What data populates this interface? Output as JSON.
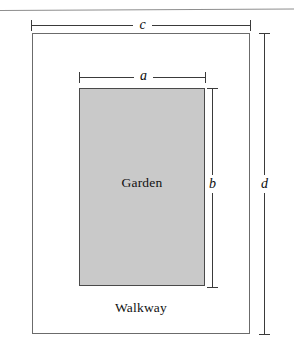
{
  "figure": {
    "type": "geometry-diagram",
    "background_color": "#ffffff",
    "page_rule": {
      "name": "page-rule",
      "color": "#8e8e8e"
    },
    "regions": [
      {
        "key": "walkway",
        "label": "Walkway",
        "fill_color": "#ffffff",
        "stroke_color": "#6b6b6b"
      },
      {
        "key": "garden",
        "label": "Garden",
        "fill_color": "#c9c9c9",
        "stroke_color": "#4a4a4a"
      }
    ],
    "dimensions": [
      {
        "key": "c",
        "label": "c",
        "orientation": "horizontal",
        "measures": "outer rectangle width",
        "position": "above outer rectangle"
      },
      {
        "key": "a",
        "label": "a",
        "orientation": "horizontal",
        "measures": "garden width",
        "position": "above garden rectangle"
      },
      {
        "key": "b",
        "label": "b",
        "orientation": "vertical",
        "measures": "garden height",
        "position": "right of garden rectangle"
      },
      {
        "key": "d",
        "label": "d",
        "orientation": "vertical",
        "measures": "outer rectangle height",
        "position": "right of outer rectangle"
      }
    ]
  },
  "chart_data": {
    "type": "diagram",
    "title": "",
    "shapes": [
      {
        "name": "outer-rectangle",
        "role": "walkway",
        "label": "Walkway",
        "x": 32,
        "y": 33,
        "width": 218,
        "height": 301,
        "fill": "#ffffff",
        "stroke": "#6b6b6b"
      },
      {
        "name": "inner-rectangle",
        "role": "garden",
        "label": "Garden",
        "x": 79,
        "y": 88,
        "width": 126,
        "height": 198,
        "fill": "#c9c9c9",
        "stroke": "#4a4a4a"
      }
    ],
    "annotations": [
      {
        "label": "c",
        "type": "dimension",
        "orientation": "horizontal",
        "from": [
          31,
          25
        ],
        "to": [
          250,
          25
        ]
      },
      {
        "label": "a",
        "type": "dimension",
        "orientation": "horizontal",
        "from": [
          79,
          77
        ],
        "to": [
          205,
          77
        ]
      },
      {
        "label": "b",
        "type": "dimension",
        "orientation": "vertical",
        "from": [
          212,
          88
        ],
        "to": [
          212,
          287
        ]
      },
      {
        "label": "d",
        "type": "dimension",
        "orientation": "vertical",
        "from": [
          264,
          33
        ],
        "to": [
          264,
          334
        ]
      }
    ],
    "text_labels": [
      {
        "text": "Garden",
        "x": 142,
        "y": 183
      },
      {
        "text": "Walkway",
        "x": 141,
        "y": 308
      }
    ]
  }
}
